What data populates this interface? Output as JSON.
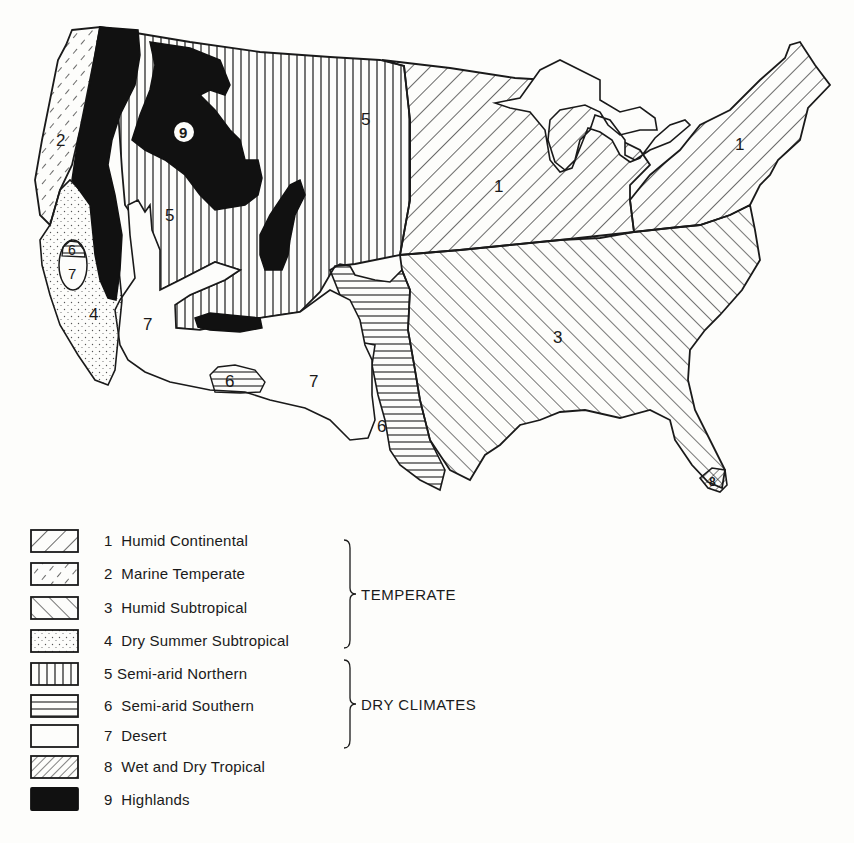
{
  "map": {
    "title": "Climate regions of the conterminous United States",
    "region_labels": [
      {
        "id": "humid-continental-west",
        "text": "1",
        "x": 494,
        "y": 192
      },
      {
        "id": "humid-continental-east",
        "text": "1",
        "x": 735,
        "y": 150
      },
      {
        "id": "marine-temperate",
        "text": "2",
        "x": 60,
        "y": 142
      },
      {
        "id": "humid-subtropical",
        "text": "3",
        "x": 558,
        "y": 343
      },
      {
        "id": "dry-summer-subtropical",
        "text": "4",
        "x": 93,
        "y": 317
      },
      {
        "id": "semi-arid-northern-east",
        "text": "5",
        "x": 365,
        "y": 125
      },
      {
        "id": "semi-arid-northern-west",
        "text": "5",
        "x": 170,
        "y": 217
      },
      {
        "id": "semi-arid-southern-texas",
        "text": "6",
        "x": 380,
        "y": 432
      },
      {
        "id": "semi-arid-southern-az",
        "text": "6",
        "x": 229,
        "y": 387
      },
      {
        "id": "semi-arid-southern-ca",
        "text": "6",
        "x": 72,
        "y": 253
      },
      {
        "id": "desert-ca",
        "text": "7",
        "x": 73,
        "y": 277
      },
      {
        "id": "desert-great-basin",
        "text": "7",
        "x": 147,
        "y": 330
      },
      {
        "id": "desert-southwest",
        "text": "7",
        "x": 313,
        "y": 387
      },
      {
        "id": "wet-dry-tropical",
        "text": "8",
        "x": 714,
        "y": 481
      },
      {
        "id": "highlands",
        "text": "9",
        "x": 184,
        "y": 138
      }
    ]
  },
  "legend": {
    "items": [
      {
        "number": "1",
        "label": "Humid Continental",
        "pattern": "humid-continental"
      },
      {
        "number": "2",
        "label": "Marine Temperate",
        "pattern": "marine-temperate"
      },
      {
        "number": "3",
        "label": "Humid Subtropical",
        "pattern": "humid-subtropical"
      },
      {
        "number": "4",
        "label": "Dry Summer Subtropical",
        "pattern": "dry-summer-subtropical"
      },
      {
        "number": "5",
        "label": "Semi-arid Northern",
        "pattern": "semi-arid-northern"
      },
      {
        "number": "6",
        "label": "Semi-arid Southern",
        "pattern": "semi-arid-southern"
      },
      {
        "number": "7",
        "label": "Desert",
        "pattern": "desert"
      },
      {
        "number": "8",
        "label": "Wet and Dry Tropical",
        "pattern": "wet-dry-tropical"
      },
      {
        "number": "9",
        "label": "Highlands",
        "pattern": "highlands"
      }
    ],
    "groups": [
      {
        "label": "TEMPERATE",
        "covers": [
          "1",
          "2",
          "3",
          "4"
        ]
      },
      {
        "label": "DRY CLIMATES",
        "covers": [
          "5",
          "6"
        ]
      }
    ]
  },
  "colors": {
    "ink": "#1a1a1a",
    "paper": "#fdfdfb"
  }
}
